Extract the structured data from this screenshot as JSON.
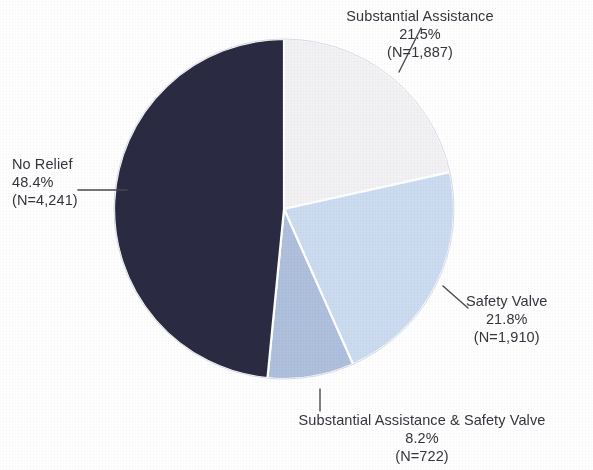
{
  "chart_data": {
    "type": "pie",
    "title": "",
    "subtitle": "",
    "xlabel": "",
    "ylabel": "",
    "legend_position": "none",
    "grid": false,
    "labels_outside": true,
    "start_angle_deg": 0,
    "direction": "clockwise",
    "total_n": 8760,
    "categories": [
      "Substantial Assistance",
      "Safety Valve",
      "Substantial Assistance & Safety Valve",
      "No Relief"
    ],
    "values": [
      21.5,
      21.8,
      8.2,
      48.4
    ],
    "counts": [
      1887,
      1910,
      722,
      4241
    ],
    "colors": [
      "#f2f2f4",
      "#ccdcf0",
      "#aec0dc",
      "#2a2a42"
    ],
    "slices": [
      {
        "name": "Substantial Assistance",
        "percent": 21.5,
        "count": 1887,
        "color": "#f2f2f4",
        "percent_text": "21.5%",
        "count_text": "(N=1,887)"
      },
      {
        "name": "Safety Valve",
        "percent": 21.8,
        "count": 1910,
        "color": "#ccdcf0",
        "percent_text": "21.8%",
        "count_text": "(N=1,910)"
      },
      {
        "name": "Substantial Assistance & Safety Valve",
        "percent": 8.2,
        "count": 722,
        "color": "#aec0dc",
        "percent_text": "8.2%",
        "count_text": "(N=722)"
      },
      {
        "name": "No Relief",
        "percent": 48.4,
        "count": 4241,
        "color": "#2a2a42",
        "percent_text": "48.4%",
        "count_text": "(N=4,241)"
      }
    ]
  },
  "labels": {
    "substantial_assistance": {
      "name": "Substantial Assistance",
      "percent": "21.5%",
      "count": "(N=1,887)"
    },
    "no_relief": {
      "name": "No Relief",
      "percent": "48.4%",
      "count": "(N=4,241)"
    },
    "safety_valve": {
      "name": "Safety Valve",
      "percent": "21.8%",
      "count": "(N=1,910)"
    },
    "both": {
      "name": "Substantial Assistance & Safety Valve",
      "percent": "8.2%",
      "count": "(N=722)"
    }
  },
  "style": {
    "background": "#ffffff",
    "slice_border": "#ffffff",
    "leader_line": "#4a4a52",
    "text": "#35353d"
  }
}
